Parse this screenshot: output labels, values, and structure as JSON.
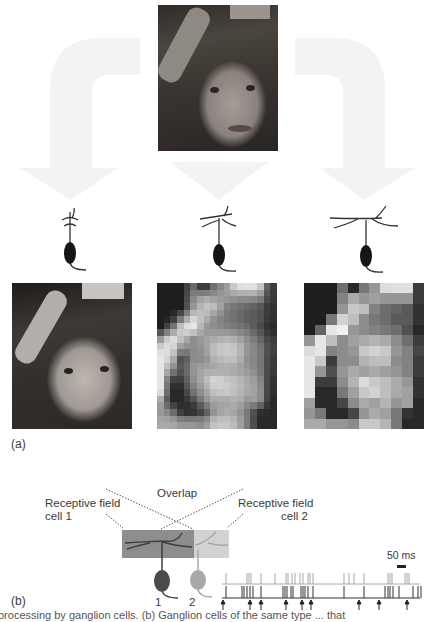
{
  "panel_a": {
    "label": "(a)",
    "source_photo": {
      "subject": "child-face-photo",
      "tone": "grayscale"
    },
    "cells": [
      {
        "id": "small-rf",
        "dendrite_span": "narrow",
        "resolution": "full"
      },
      {
        "id": "medium-rf",
        "dendrite_span": "medium",
        "resolution": "pixelated-fine",
        "grid": [
          18,
          22
        ]
      },
      {
        "id": "large-rf",
        "dendrite_span": "wide",
        "resolution": "pixelated-coarse",
        "grid": [
          11,
          14
        ]
      }
    ],
    "coarse_grid_values": [
      [
        30,
        30,
        30,
        110,
        40,
        120,
        150,
        220,
        225,
        225,
        60
      ],
      [
        30,
        30,
        30,
        130,
        170,
        150,
        160,
        150,
        150,
        150,
        60
      ],
      [
        30,
        30,
        30,
        150,
        200,
        190,
        130,
        110,
        100,
        90,
        50
      ],
      [
        30,
        30,
        120,
        210,
        190,
        140,
        120,
        110,
        90,
        90,
        50
      ],
      [
        30,
        100,
        230,
        240,
        150,
        140,
        130,
        120,
        110,
        80,
        40
      ],
      [
        150,
        230,
        190,
        140,
        160,
        170,
        180,
        170,
        140,
        110,
        60
      ],
      [
        220,
        230,
        130,
        140,
        150,
        200,
        210,
        200,
        150,
        130,
        70
      ],
      [
        230,
        200,
        60,
        140,
        140,
        180,
        190,
        190,
        140,
        130,
        60
      ],
      [
        230,
        150,
        80,
        150,
        170,
        160,
        170,
        160,
        150,
        130,
        60
      ],
      [
        230,
        60,
        60,
        140,
        180,
        220,
        200,
        190,
        170,
        150,
        50
      ],
      [
        230,
        40,
        40,
        120,
        160,
        200,
        210,
        190,
        170,
        160,
        50
      ],
      [
        160,
        40,
        40,
        70,
        140,
        170,
        160,
        180,
        150,
        160,
        40
      ],
      [
        150,
        120,
        40,
        40,
        70,
        150,
        170,
        160,
        120,
        50,
        40
      ],
      [
        170,
        170,
        150,
        150,
        140,
        200,
        200,
        180,
        120,
        40,
        40
      ]
    ]
  },
  "panel_b": {
    "label": "(b)",
    "overlap_label": "Overlap",
    "rf1_label_line1": "Receptive field",
    "rf1_label_line2": "cell 1",
    "rf2_label_line1": "Receptive field",
    "rf2_label_line2": "cell 2",
    "cell1_number": "1",
    "cell2_number": "2",
    "scale_bar_label": "50 ms",
    "colors": {
      "cell1": "#4a4a4a",
      "cell2": "#a8a8a8",
      "rf1_fill": "#8d8d8d",
      "rf2_fill": "#d2d2d2"
    },
    "spike_train_cell2_x": [
      226,
      247,
      249,
      251,
      261,
      275,
      286,
      288,
      292,
      295,
      300,
      303,
      308,
      310,
      313,
      344,
      349,
      354,
      364,
      388,
      390,
      392,
      405,
      407,
      409
    ],
    "spike_train_cell1_x": [
      226,
      242,
      244,
      247,
      250,
      253,
      261,
      283,
      285,
      287,
      291,
      293,
      301,
      303,
      305,
      308,
      313,
      344,
      364,
      385,
      388,
      390,
      393,
      399,
      413,
      418,
      421
    ],
    "sync_arrows_x": [
      223,
      250,
      261,
      286,
      302,
      311,
      359,
      379,
      407
    ]
  },
  "caption_fragment": "processing by ganglion cells. (b) Ganglion cells of the same type ... that"
}
